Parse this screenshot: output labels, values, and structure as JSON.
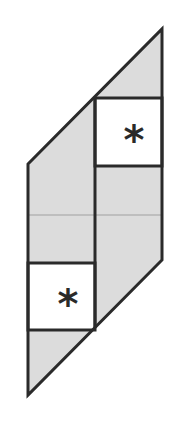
{
  "diagram": {
    "shape": "parallelogram",
    "fill_color": "#dcdcdc",
    "stroke_color": "#2a2a2a",
    "divider_color": "#a0a0a0",
    "background": "#ffffff",
    "outline": [
      [
        28,
        164
      ],
      [
        162,
        29
      ],
      [
        162,
        260
      ],
      [
        28,
        395
      ]
    ],
    "middle_divider_x": 95,
    "center_line_y": 215,
    "boxes": [
      {
        "id": "upper-box",
        "x": 95,
        "y": 98,
        "width": 67,
        "height": 68,
        "fill": "#ffffff",
        "symbol": "*",
        "symbol_x": 134,
        "symbol_y": 150
      },
      {
        "id": "lower-box",
        "x": 28,
        "y": 263,
        "width": 67,
        "height": 67,
        "fill": "#ffffff",
        "symbol": "*",
        "symbol_x": 68,
        "symbol_y": 314
      }
    ]
  }
}
